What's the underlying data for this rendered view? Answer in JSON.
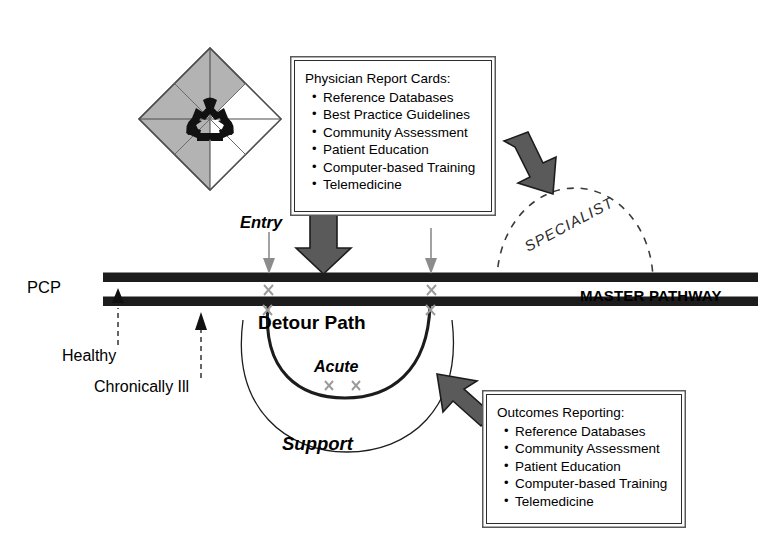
{
  "diagram": {
    "colors": {
      "pathway_bar": "#1c1c1c",
      "diamond_fill": "#b3b3b3",
      "diamond_stroke": "#4d4d4d",
      "arrow_fill": "#5a5a5a",
      "arrow_stroke": "#1c1c1c",
      "thin_arrow": "#8c8c8c",
      "marker_x": "#9a9a9a",
      "curve": "#1c1c1c",
      "dashed_arc": "#3b3b3b",
      "box_border": "#2b2b2b",
      "box_outer": "#5a5a5a",
      "background": "#ffffff"
    }
  },
  "logo": {
    "name": "recycling-diamond-logo",
    "quadrants": [
      {
        "position": "top",
        "shade": "gray"
      },
      {
        "position": "left",
        "shade": "gray"
      },
      {
        "position": "bottom",
        "shade": "gray"
      },
      {
        "position": "right",
        "shade": "white"
      }
    ],
    "center_symbol": "recycle-icon"
  },
  "pathway": {
    "master_label": "MASTER PATHWAY",
    "pcp_label": "PCP",
    "entry_label": "Entry",
    "detour_label": "Detour Path",
    "acute_label": "Acute",
    "support_label": "Support",
    "specialist_label": "SPECIALIST",
    "healthy_label": "Healthy",
    "chronically_ill_label": "Chronically Ill"
  },
  "boxes": [
    {
      "id": "physician-report-cards",
      "title": "Physician Report Cards:",
      "items": [
        "Reference Databases",
        "Best Practice Guidelines",
        "Community Assessment",
        "Patient Education",
        "Computer-based Training",
        "Telemedicine"
      ]
    },
    {
      "id": "outcomes-reporting",
      "title": "Outcomes Reporting:",
      "items": [
        "Reference Databases",
        "Community Assessment",
        "Patient Education",
        "Computer-based Training",
        "Telemedicine"
      ]
    }
  ]
}
